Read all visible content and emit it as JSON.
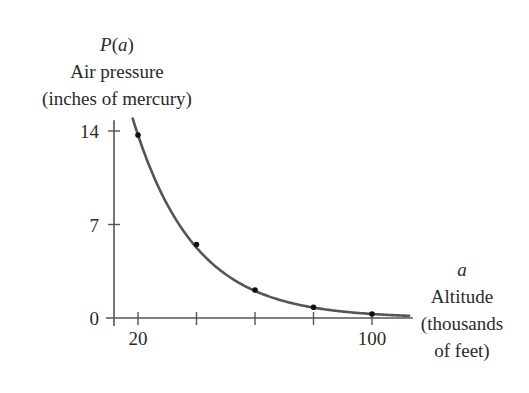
{
  "chart_data": {
    "type": "line",
    "title": "",
    "ylabel": {
      "symbol": "P(a)",
      "symbol_parts": [
        "P(",
        "a",
        ")"
      ],
      "line1": "Air pressure",
      "line2": "(inches of mercury)"
    },
    "xlabel": {
      "symbol": "a",
      "line1": "Altitude",
      "line2": "(thousands",
      "line3": "of feet)"
    },
    "x_ticks": [
      20,
      40,
      60,
      80,
      100
    ],
    "x_tick_labels": [
      "20",
      "",
      "",
      "",
      "100"
    ],
    "y_ticks": [
      0,
      7,
      14
    ],
    "y_tick_labels": [
      "0",
      "7",
      "14"
    ],
    "xlim": [
      10,
      114
    ],
    "ylim": [
      0,
      14.8
    ],
    "grid": false,
    "legend": null,
    "series": [
      {
        "name": "P(a)",
        "marked_points": {
          "x": [
            20,
            40,
            60,
            80,
            100
          ],
          "y": [
            13.7,
            5.5,
            2.1,
            0.8,
            0.3
          ]
        },
        "curve": "exponential decay through marked points"
      }
    ],
    "colors": {
      "curve": "#555555",
      "axis": "#555555",
      "point": "#111111",
      "text": "#2a2a2a"
    }
  }
}
